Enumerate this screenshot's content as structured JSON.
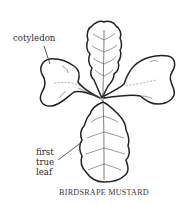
{
  "figure": {
    "title": "BIRDSRAPE MUSTARD",
    "labels": {
      "cotyledon": "cotyledon",
      "true_leaf_line1": "first",
      "true_leaf_line2": "true",
      "true_leaf_line3": "leaf"
    },
    "parts": [
      "cotyledon-left",
      "cotyledon-right",
      "true-leaf-top",
      "first-true-leaf-bottom",
      "stem"
    ],
    "colors": {
      "ink": "#222222",
      "background": "#ffffff"
    }
  }
}
